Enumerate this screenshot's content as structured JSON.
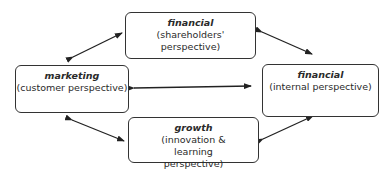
{
  "diagram": {
    "type": "balanced-scorecard-perspectives",
    "nodes": [
      {
        "id": "financial-shareholders",
        "title": "financial",
        "subtitle": "(shareholders' perspective)"
      },
      {
        "id": "marketing",
        "title": "marketing",
        "subtitle": "(customer perspective)"
      },
      {
        "id": "financial-internal",
        "title": "financial",
        "subtitle": "(internal perspective)"
      },
      {
        "id": "growth",
        "title": "growth",
        "subtitle": "(innovation & learning perspective)"
      }
    ],
    "edges": [
      {
        "from": "marketing",
        "to": "financial-shareholders",
        "bidirectional": true
      },
      {
        "from": "financial-shareholders",
        "to": "financial-internal",
        "bidirectional": true
      },
      {
        "from": "marketing",
        "to": "financial-internal",
        "bidirectional": true
      },
      {
        "from": "marketing",
        "to": "growth",
        "bidirectional": true
      },
      {
        "from": "growth",
        "to": "financial-internal",
        "bidirectional": true
      }
    ]
  }
}
